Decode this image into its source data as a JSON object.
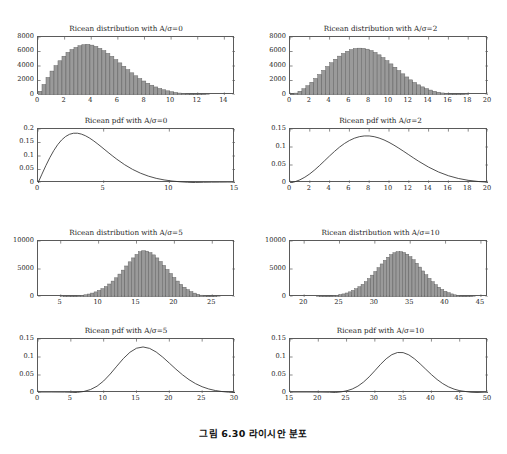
{
  "caption": "그림 6.30  라이시안 분포",
  "figure": {
    "panels": [
      {
        "id": "hist-0",
        "title": "Ricean distribution with A/σ=0",
        "kind": "histogram",
        "xlabel": "",
        "ylabel": "",
        "xlim": [
          0,
          14.8
        ],
        "ylim": [
          0,
          8000
        ],
        "xticks": [
          0,
          2,
          4,
          6,
          8,
          10,
          12,
          14
        ],
        "yticks": [
          0,
          2000,
          4000,
          6000,
          8000
        ],
        "xticklabels": [
          "0",
          "2",
          "4",
          "6",
          "8",
          "10",
          "12",
          "14"
        ],
        "yticklabels": [
          "0",
          "2000",
          "4000",
          "6000",
          "8000"
        ],
        "bin_width": 0.3,
        "bin_start": 0.0,
        "values": [
          520,
          1450,
          2420,
          3300,
          4050,
          4720,
          5350,
          5880,
          6270,
          6560,
          6790,
          6930,
          6980,
          6880,
          6700,
          6430,
          6120,
          5740,
          5330,
          4880,
          4430,
          3960,
          3500,
          3060,
          2650,
          2270,
          1930,
          1620,
          1350,
          1110,
          900,
          720,
          575,
          450,
          350,
          268,
          203,
          152,
          112,
          81,
          58,
          41,
          28,
          19,
          13,
          9,
          6,
          4,
          2,
          1
        ]
      },
      {
        "id": "hist-2",
        "title": "Ricean distribution with A/σ=2",
        "kind": "histogram",
        "xlim": [
          0,
          20
        ],
        "ylim": [
          0,
          8000
        ],
        "xticks": [
          0,
          2,
          4,
          6,
          8,
          10,
          12,
          14,
          16,
          18,
          20
        ],
        "yticks": [
          0,
          2000,
          4000,
          6000,
          8000
        ],
        "xticklabels": [
          "0",
          "2",
          "4",
          "6",
          "8",
          "10",
          "12",
          "14",
          "16",
          "18",
          "20"
        ],
        "yticklabels": [
          "0",
          "2000",
          "4000",
          "6000",
          "8000"
        ],
        "bin_width": 0.4,
        "bin_start": 0.0,
        "values": [
          90,
          260,
          520,
          860,
          1280,
          1760,
          2280,
          2830,
          3390,
          3930,
          4450,
          4930,
          5360,
          5730,
          6030,
          6260,
          6400,
          6460,
          6430,
          6320,
          6130,
          5870,
          5540,
          5160,
          4740,
          4290,
          3830,
          3370,
          2920,
          2490,
          2090,
          1730,
          1400,
          1120,
          880,
          680,
          515,
          385,
          282,
          203,
          143,
          99,
          68,
          45,
          30,
          19,
          12,
          8,
          5,
          3
        ]
      },
      {
        "id": "pdf-0",
        "title": "Ricean pdf with A/σ=0",
        "kind": "line",
        "xlim": [
          0,
          15
        ],
        "ylim": [
          0,
          0.2
        ],
        "xticks": [
          0,
          5,
          10,
          15
        ],
        "yticks": [
          0,
          0.05,
          0.1,
          0.15,
          0.2
        ],
        "xticklabels": [
          "0",
          "5",
          "10",
          "15"
        ],
        "yticklabels": [
          "0",
          "0.05",
          "0.1",
          "0.15",
          "0.2"
        ],
        "sigma": 3.0,
        "nu": 0.0,
        "x": [
          0,
          0.3,
          0.6,
          0.9,
          1.2,
          1.5,
          1.8,
          2.1,
          2.4,
          2.7,
          3.0,
          3.3,
          3.6,
          3.9,
          4.2,
          4.5,
          4.8,
          5.1,
          5.4,
          5.7,
          6.0,
          6.6,
          7.2,
          7.8,
          8.4,
          9.0,
          9.6,
          10.2,
          10.8,
          11.4,
          12.0,
          12.6,
          13.2,
          13.8,
          14.4,
          15.0
        ],
        "y": [
          0.0,
          0.0328,
          0.0645,
          0.0939,
          0.12,
          0.142,
          0.1594,
          0.1722,
          0.1804,
          0.1843,
          0.1844,
          0.1812,
          0.1753,
          0.1672,
          0.1574,
          0.1464,
          0.1348,
          0.1228,
          0.1109,
          0.0993,
          0.0881,
          0.0677,
          0.0504,
          0.0364,
          0.0255,
          0.0173,
          0.0114,
          0.0073,
          0.0045,
          0.0027,
          0.0016,
          0.0009,
          0.0005,
          0.0003,
          0.0001,
          0.0001
        ]
      },
      {
        "id": "pdf-2",
        "title": "Ricean pdf with A/σ=2",
        "kind": "line",
        "xlim": [
          0,
          20
        ],
        "ylim": [
          0,
          0.15
        ],
        "xticks": [
          0,
          2,
          4,
          6,
          8,
          10,
          12,
          14,
          16,
          18,
          20
        ],
        "yticks": [
          0,
          0.05,
          0.1,
          0.15
        ],
        "xticklabels": [
          "0",
          "2",
          "4",
          "6",
          "8",
          "10",
          "12",
          "14",
          "16",
          "18",
          "20"
        ],
        "yticklabels": [
          "0",
          "0.05",
          "0.1",
          "0.15"
        ],
        "sigma": 3.0,
        "nu": 6.0,
        "x": [
          0,
          0.5,
          1.0,
          1.5,
          2.0,
          2.5,
          3.0,
          3.5,
          4.0,
          4.5,
          5.0,
          5.5,
          6.0,
          6.5,
          7.0,
          7.5,
          8.0,
          8.5,
          9.0,
          9.5,
          10.0,
          10.5,
          11.0,
          11.5,
          12.0,
          12.5,
          13.0,
          14.0,
          15.0,
          16.0,
          17.0,
          18.0,
          19.0,
          20.0
        ],
        "y": [
          0.0,
          0.0035,
          0.0088,
          0.0161,
          0.0254,
          0.0365,
          0.0489,
          0.062,
          0.0752,
          0.0879,
          0.0996,
          0.1097,
          0.118,
          0.1244,
          0.1286,
          0.1307,
          0.1307,
          0.1287,
          0.1249,
          0.1196,
          0.1129,
          0.1051,
          0.0966,
          0.0876,
          0.0784,
          0.0692,
          0.0603,
          0.0441,
          0.0306,
          0.0202,
          0.0126,
          0.0075,
          0.0042,
          0.0022
        ]
      },
      {
        "id": "hist-5",
        "title": "Ricean distribution with A/σ=5",
        "kind": "histogram",
        "xlim": [
          2,
          28
        ],
        "ylim": [
          0,
          10000
        ],
        "xticks": [
          5,
          10,
          15,
          20,
          25
        ],
        "yticks": [
          0,
          5000,
          10000
        ],
        "xticklabels": [
          "5",
          "10",
          "15",
          "20",
          "25"
        ],
        "yticklabels": [
          "0",
          "5000",
          "10000"
        ],
        "bin_width": 0.45,
        "bin_start": 4.0,
        "values": [
          10,
          18,
          30,
          48,
          72,
          105,
          150,
          210,
          290,
          395,
          530,
          700,
          910,
          1170,
          1490,
          1870,
          2320,
          2840,
          3430,
          4090,
          4800,
          5540,
          6280,
          6980,
          7600,
          8090,
          8260,
          8180,
          7930,
          7520,
          6980,
          6340,
          5640,
          4920,
          4190,
          3490,
          2840,
          2250,
          1740,
          1310,
          960,
          690,
          480,
          325,
          213,
          136,
          84,
          50,
          29,
          16,
          9,
          5,
          2
        ]
      },
      {
        "id": "hist-10",
        "title": "Ricean distribution with A/σ=10",
        "kind": "histogram",
        "xlim": [
          18,
          46
        ],
        "ylim": [
          0,
          10000
        ],
        "xticks": [
          20,
          25,
          30,
          35,
          40,
          45
        ],
        "yticks": [
          0,
          5000,
          10000
        ],
        "xticklabels": [
          "20",
          "25",
          "30",
          "35",
          "40",
          "45"
        ],
        "yticklabels": [
          "0",
          "5000",
          "10000"
        ],
        "bin_width": 0.45,
        "bin_start": 19.5,
        "values": [
          4,
          7,
          11,
          17,
          26,
          39,
          57,
          83,
          118,
          165,
          228,
          310,
          415,
          550,
          715,
          920,
          1170,
          1470,
          1830,
          2250,
          2740,
          3290,
          3900,
          4550,
          5230,
          5900,
          6540,
          7100,
          7570,
          7900,
          8080,
          8090,
          7940,
          7640,
          7200,
          6650,
          6020,
          5340,
          4650,
          3970,
          3320,
          2730,
          2200,
          1740,
          1350,
          1020,
          760,
          550,
          390,
          270,
          182,
          120,
          77,
          48,
          29,
          17,
          10,
          6,
          3,
          2
        ]
      },
      {
        "id": "pdf-5",
        "title": "Ricean pdf with A/σ=5",
        "kind": "line",
        "xlim": [
          0,
          30
        ],
        "ylim": [
          0,
          0.15
        ],
        "xticks": [
          0,
          5,
          10,
          15,
          20,
          25,
          30
        ],
        "yticks": [
          0,
          0.05,
          0.1,
          0.15
        ],
        "xticklabels": [
          "0",
          "5",
          "10",
          "15",
          "20",
          "25",
          "30"
        ],
        "yticklabels": [
          "0",
          "0.05",
          "0.1",
          "0.15"
        ],
        "sigma": 3.1,
        "nu": 15.5,
        "x": [
          0,
          2,
          4,
          5,
          6,
          7,
          8,
          9,
          10,
          11,
          12,
          13,
          14,
          15,
          16,
          17,
          18,
          19,
          20,
          21,
          22,
          23,
          24,
          25,
          26,
          27,
          28,
          29,
          30
        ],
        "y": [
          0.0,
          0.0,
          0.0002,
          0.0006,
          0.0017,
          0.0043,
          0.0096,
          0.019,
          0.0335,
          0.0527,
          0.0745,
          0.0957,
          0.1131,
          0.1244,
          0.1279,
          0.1239,
          0.1138,
          0.0995,
          0.083,
          0.0662,
          0.0506,
          0.037,
          0.0259,
          0.0174,
          0.0112,
          0.0069,
          0.0041,
          0.0023,
          0.0012
        ]
      },
      {
        "id": "pdf-10",
        "title": "Ricean pdf with A/σ=10",
        "kind": "line",
        "xlim": [
          15,
          50
        ],
        "ylim": [
          0,
          0.15
        ],
        "xticks": [
          15,
          20,
          25,
          30,
          35,
          40,
          45,
          50
        ],
        "yticks": [
          0,
          0.05,
          0.1,
          0.15
        ],
        "xticklabels": [
          "15",
          "20",
          "25",
          "30",
          "35",
          "40",
          "45",
          "50"
        ],
        "yticklabels": [
          "0",
          "0.05",
          "0.1",
          "0.15"
        ],
        "sigma": 3.15,
        "nu": 31.5,
        "x": [
          15,
          18,
          20,
          22,
          23,
          24,
          25,
          26,
          27,
          28,
          29,
          30,
          31,
          32,
          33,
          34,
          35,
          36,
          37,
          38,
          39,
          40,
          41,
          42,
          43,
          44,
          45,
          47,
          50
        ],
        "y": [
          0.0,
          0.0,
          0.0001,
          0.0006,
          0.0014,
          0.003,
          0.006,
          0.011,
          0.019,
          0.0304,
          0.045,
          0.062,
          0.0795,
          0.095,
          0.1065,
          0.1125,
          0.1122,
          0.106,
          0.095,
          0.081,
          0.066,
          0.0511,
          0.0375,
          0.0261,
          0.0172,
          0.0108,
          0.0064,
          0.002,
          0.0002
        ]
      }
    ]
  },
  "style": {
    "bar_fill": "#9a9a9a",
    "bar_edge": "#5c5c5c",
    "axis_color": "#5a5a5a",
    "line_color": "#303030",
    "text_color": "#1c1c1c"
  }
}
